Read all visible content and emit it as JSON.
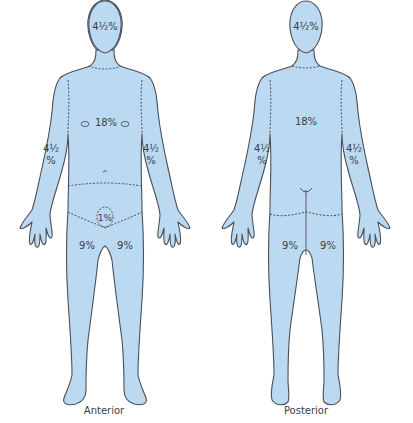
{
  "colors": {
    "body_fill": "#bcd9f2",
    "outline": "#4a4f57",
    "text": "#3a3f47"
  },
  "figures": [
    {
      "view": "Anterior",
      "labels": {
        "head": "4½%",
        "trunk": "18%",
        "left_arm_a": "4½",
        "left_arm_b": "%",
        "right_arm_a": "4½",
        "right_arm_b": "%",
        "perineum": "1%",
        "left_leg": "9%",
        "right_leg": "9%"
      }
    },
    {
      "view": "Posterior",
      "labels": {
        "head": "4½%",
        "trunk": "18%",
        "left_arm_a": "4½",
        "left_arm_b": "%",
        "right_arm_a": "4½",
        "right_arm_b": "%",
        "left_leg": "9%",
        "right_leg": "9%"
      }
    }
  ]
}
